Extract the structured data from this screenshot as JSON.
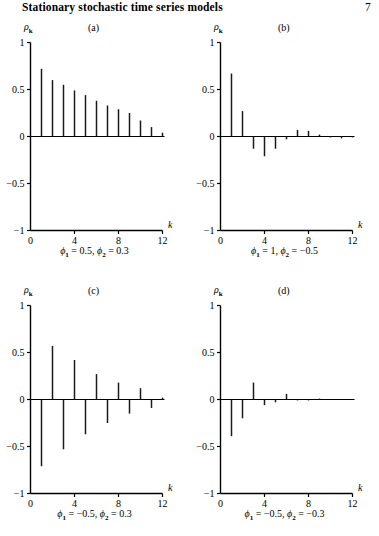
{
  "header": {
    "title": "Stationary stochastic time series models",
    "page_number": "7"
  },
  "axes": {
    "ylabel": "ρ",
    "ylabel_sub": "k",
    "xlabel": "k",
    "ytick_labels": [
      "1",
      "0.5",
      "0",
      "−0.5",
      "−1"
    ],
    "ytick_values": [
      1,
      0.5,
      0,
      -0.5,
      -1
    ],
    "xtick_labels": [
      "0",
      "4",
      "8",
      "12"
    ],
    "xtick_values": [
      0,
      4,
      8,
      12
    ],
    "xlim": [
      0,
      12
    ],
    "ylim": [
      -1,
      1
    ],
    "grid": false,
    "legend": "none"
  },
  "chart_data": [
    {
      "type": "bar",
      "panel": "(a)",
      "title": "(a)",
      "caption_phi1": "0.5",
      "caption_phi2": "0.3",
      "caption": "φ₁ = 0.5, φ₂ = 0.3",
      "xlabel": "k",
      "ylabel": "ρk",
      "xlim": [
        0,
        12
      ],
      "ylim": [
        -1,
        1
      ],
      "categories": [
        1,
        2,
        3,
        4,
        5,
        6,
        7,
        8,
        9,
        10,
        11,
        12
      ],
      "values": [
        0.72,
        0.6,
        0.55,
        0.49,
        0.44,
        0.38,
        0.33,
        0.29,
        0.25,
        0.17,
        0.1,
        0.04
      ]
    },
    {
      "type": "bar",
      "panel": "(b)",
      "title": "(b)",
      "caption_phi1": "1",
      "caption_phi2": "−0.5",
      "caption": "φ₁ = 1, φ₂ = −0.5",
      "xlabel": "k",
      "ylabel": "ρk",
      "xlim": [
        0,
        12
      ],
      "ylim": [
        -1,
        1
      ],
      "categories": [
        1,
        2,
        3,
        4,
        5,
        6,
        7,
        8,
        9,
        10,
        11,
        12
      ],
      "values": [
        0.67,
        0.27,
        -0.13,
        -0.21,
        -0.13,
        -0.03,
        0.07,
        0.06,
        0.02,
        -0.01,
        -0.02,
        -0.01
      ]
    },
    {
      "type": "bar",
      "panel": "(c)",
      "title": "(c)",
      "caption_phi1": "−0.5",
      "caption_phi2": "0.3",
      "caption": "φ₁ = −0.5, φ₂ = 0.3",
      "xlabel": "k",
      "ylabel": "ρk",
      "xlim": [
        0,
        12
      ],
      "ylim": [
        -1,
        1
      ],
      "categories": [
        1,
        2,
        3,
        4,
        5,
        6,
        7,
        8,
        9,
        10,
        11,
        12
      ],
      "values": [
        -0.71,
        0.57,
        -0.53,
        0.42,
        -0.37,
        0.27,
        -0.25,
        0.18,
        -0.15,
        0.12,
        -0.09,
        0.02
      ]
    },
    {
      "type": "bar",
      "panel": "(d)",
      "title": "(d)",
      "caption_phi1": "−0.5",
      "caption_phi2": "−0.3",
      "caption": "φ₁ = −0.5, φ₂ = −0.3",
      "xlabel": "k",
      "ylabel": "ρk",
      "xlim": [
        0,
        12
      ],
      "ylim": [
        -1,
        1
      ],
      "categories": [
        1,
        2,
        3,
        4,
        5,
        6,
        7,
        8,
        9,
        10,
        11,
        12
      ],
      "values": [
        -0.39,
        -0.2,
        0.18,
        -0.06,
        -0.03,
        0.06,
        -0.01,
        -0.01,
        0.01,
        0.0,
        0.0,
        0.0
      ]
    }
  ],
  "style": {
    "bar_color": "#1a1a1a",
    "axis_color": "#000000",
    "background": "#ffffff"
  }
}
